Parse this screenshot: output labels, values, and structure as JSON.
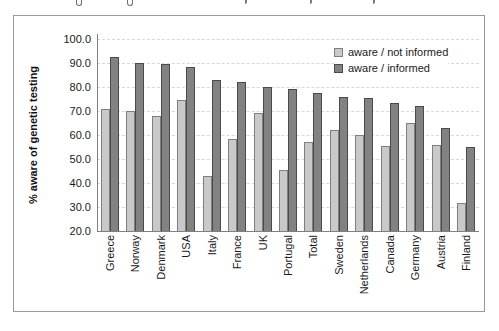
{
  "page": {
    "background": "#ffffff",
    "frame_border": "#9a9a9a"
  },
  "chart_data": {
    "type": "bar",
    "title": "",
    "xlabel": "",
    "ylabel": "% aware of genetic testing",
    "ylim": [
      20,
      100
    ],
    "ytick_step": 10,
    "ytick_labels": [
      "100.0",
      "90.0",
      "80.0",
      "70.0",
      "60.0",
      "50.0",
      "40.0",
      "30.0",
      "20.0"
    ],
    "grid": "horizontal dashed gridlines, plot background white",
    "legend_position": "top-right inside plot area",
    "categories": [
      "Greece",
      "Norway",
      "Denmark",
      "USA",
      "Italy",
      "France",
      "UK",
      "Portugal",
      "Total",
      "Sweden",
      "Netherlands",
      "Canada",
      "Germany",
      "Austria",
      "Finland"
    ],
    "series": [
      {
        "name": "aware / not informed",
        "color": "#c9c9c9",
        "border_color": "#7f7f7f",
        "values": [
          71,
          70,
          68,
          74.5,
          43,
          58.5,
          69,
          45.5,
          57,
          62,
          60,
          55.5,
          65,
          56,
          31.5
        ]
      },
      {
        "name": "aware / informed",
        "color": "#828282",
        "border_color": "#4a4a4a",
        "values": [
          92.5,
          90,
          89.5,
          88.5,
          83,
          82,
          80,
          79,
          77.5,
          76,
          75.5,
          73.5,
          72,
          63,
          55
        ]
      }
    ]
  }
}
